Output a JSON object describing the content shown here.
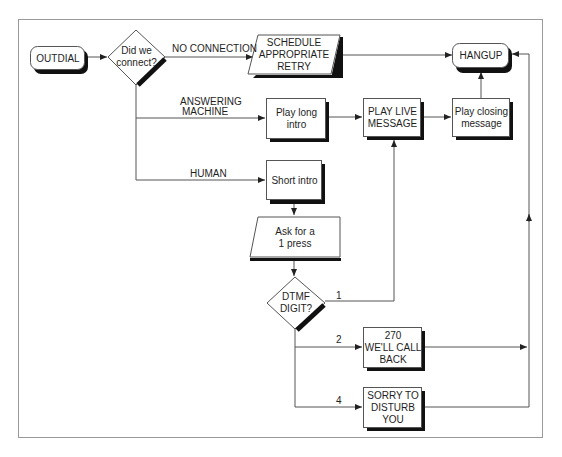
{
  "diagram": {
    "type": "flowchart",
    "nodes": {
      "outdial": {
        "label": "OUTDIAL",
        "shape": "rounded-rect"
      },
      "did_we_connect": {
        "line1": "Did we",
        "line2": "connect?",
        "shape": "diamond"
      },
      "schedule_retry": {
        "line1": "SCHEDULE",
        "line2": "APPROPRIATE",
        "line3": "RETRY",
        "shape": "parallelogram"
      },
      "hangup": {
        "label": "HANGUP",
        "shape": "rounded-rect"
      },
      "play_long_intro": {
        "line1": "Play long",
        "line2": "intro",
        "shape": "rect"
      },
      "play_live_message": {
        "line1": "PLAY LIVE",
        "line2": "MESSAGE",
        "shape": "rect"
      },
      "play_closing_message": {
        "line1": "Play closing",
        "line2": "message",
        "shape": "rect"
      },
      "short_intro": {
        "label": "Short intro",
        "shape": "rect"
      },
      "ask_for_1_press": {
        "line1": "Ask for a",
        "line2": "1 press",
        "shape": "parallelogram"
      },
      "dtmf_digit": {
        "line1": "DTMF",
        "line2": "DIGIT?",
        "shape": "diamond"
      },
      "well_call_back": {
        "line1": "270",
        "line2": "WE'LL CALL",
        "line3": "BACK",
        "shape": "rect"
      },
      "sorry_to_disturb": {
        "line1": "SORRY TO",
        "line2": "DISTURB",
        "line3": "YOU",
        "shape": "rect"
      }
    },
    "edge_labels": {
      "no_connection": "NO CONNECTION",
      "answering_machine_1": "ANSWERING",
      "answering_machine_2": "MACHINE",
      "human": "HUMAN",
      "digit_1": "1",
      "digit_2": "2",
      "digit_4": "4"
    },
    "edges": [
      {
        "from": "OUTDIAL",
        "to": "Did we connect?"
      },
      {
        "from": "Did we connect?",
        "to": "SCHEDULE APPROPRIATE RETRY",
        "label": "NO CONNECTION"
      },
      {
        "from": "SCHEDULE APPROPRIATE RETRY",
        "to": "HANGUP"
      },
      {
        "from": "Did we connect?",
        "to": "Play long intro",
        "label": "ANSWERING MACHINE"
      },
      {
        "from": "Play long intro",
        "to": "PLAY LIVE MESSAGE"
      },
      {
        "from": "PLAY LIVE MESSAGE",
        "to": "Play closing message"
      },
      {
        "from": "Play closing message",
        "to": "HANGUP"
      },
      {
        "from": "Did we connect?",
        "to": "Short intro",
        "label": "HUMAN"
      },
      {
        "from": "Short intro",
        "to": "Ask for a 1 press"
      },
      {
        "from": "Ask for a 1 press",
        "to": "DTMF DIGIT?"
      },
      {
        "from": "DTMF DIGIT?",
        "to": "PLAY LIVE MESSAGE",
        "label": "1"
      },
      {
        "from": "DTMF DIGIT?",
        "to": "270 WE'LL CALL BACK",
        "label": "2"
      },
      {
        "from": "DTMF DIGIT?",
        "to": "SORRY TO DISTURB YOU",
        "label": "4"
      },
      {
        "from": "270 WE'LL CALL BACK",
        "to": "HANGUP"
      },
      {
        "from": "SORRY TO DISTURB YOU",
        "to": "HANGUP"
      }
    ]
  }
}
